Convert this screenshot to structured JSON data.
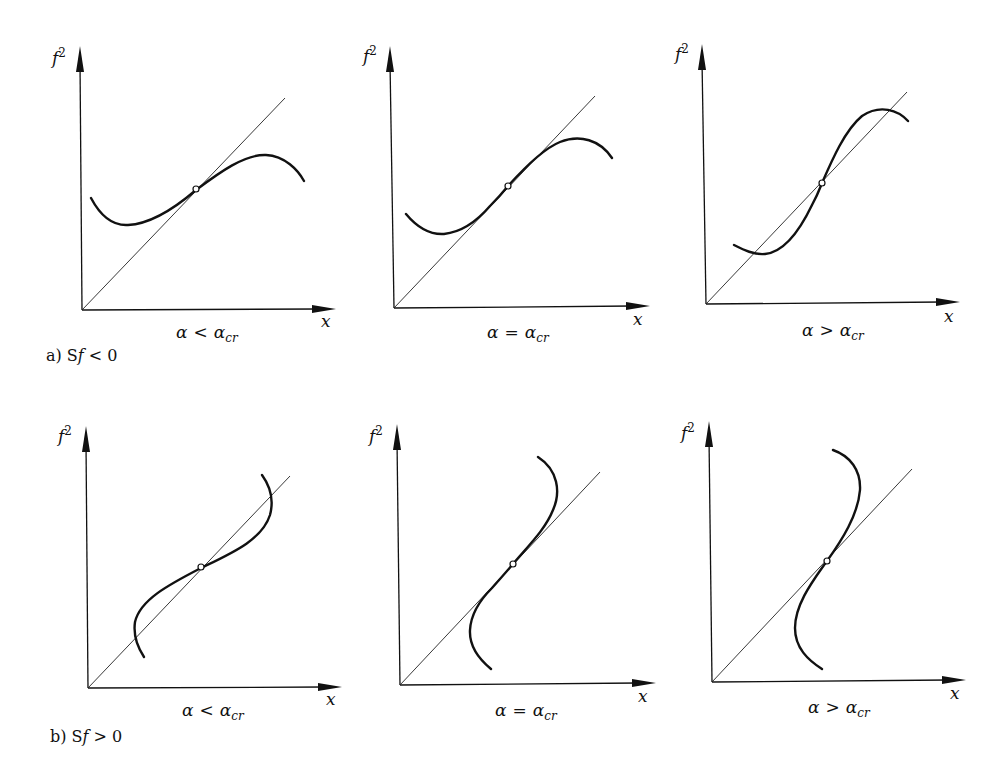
{
  "figure": {
    "rows": [
      {
        "caption": "a) Sf < 0",
        "caption_parts": {
          "prefix": "a) S",
          "var": "f",
          "rel": " < 0"
        },
        "panels": [
          {
            "id": "a1",
            "condition": "α < α_cr",
            "cond_lhs": "α",
            "cond_op": "<",
            "cond_rhs": "α",
            "cond_sub": "cr",
            "y_label": "f",
            "y_sup": "2",
            "x_label": "x"
          },
          {
            "id": "a2",
            "condition": "α = α_cr",
            "cond_lhs": "α",
            "cond_op": "=",
            "cond_rhs": "α",
            "cond_sub": "cr",
            "y_label": "f",
            "y_sup": "2",
            "x_label": "x"
          },
          {
            "id": "a3",
            "condition": "α > α_cr",
            "cond_lhs": "α",
            "cond_op": ">",
            "cond_rhs": "α",
            "cond_sub": "cr",
            "y_label": "f",
            "y_sup": "2",
            "x_label": "x"
          }
        ]
      },
      {
        "caption": "b) Sf > 0",
        "caption_parts": {
          "prefix": "b) S",
          "var": "f",
          "rel": " > 0"
        },
        "panels": [
          {
            "id": "b1",
            "condition": "α < α_cr",
            "cond_lhs": "α",
            "cond_op": "<",
            "cond_rhs": "α",
            "cond_sub": "cr",
            "y_label": "f",
            "y_sup": "2",
            "x_label": "x"
          },
          {
            "id": "b2",
            "condition": "α = α_cr",
            "cond_lhs": "α",
            "cond_op": "=",
            "cond_rhs": "α",
            "cond_sub": "cr",
            "y_label": "f",
            "y_sup": "2",
            "x_label": "x"
          },
          {
            "id": "b3",
            "condition": "α > α_cr",
            "cond_lhs": "α",
            "cond_op": ">",
            "cond_rhs": "α",
            "cond_sub": "cr",
            "y_label": "f",
            "y_sup": "2",
            "x_label": "x"
          }
        ]
      }
    ],
    "elements": {
      "axes": "f² vs x, origin bottom-left",
      "reference_line": "diagonal through origin (f² = x)",
      "curve": "cubic-like response curve",
      "marker": "open circle at equilibrium intersection"
    }
  }
}
